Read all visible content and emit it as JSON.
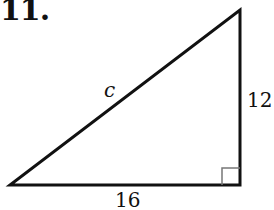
{
  "problem_number": "11.",
  "triangle": {
    "hypotenuse_label": "c",
    "vertical_leg_label": "12",
    "horizontal_leg_label": "16",
    "right_angle_marker": "square",
    "stroke_color": "#111111"
  }
}
